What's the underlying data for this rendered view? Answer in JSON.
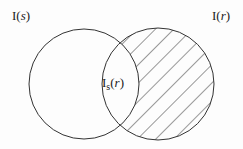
{
  "diagram": {
    "type": "venn",
    "sets": [
      {
        "id": "left",
        "label_main": "I",
        "label_arg": "s",
        "cx": 84,
        "cy": 84,
        "r": 55,
        "hatched": false
      },
      {
        "id": "right",
        "label_main": "I",
        "label_arg": "r",
        "cx": 158,
        "cy": 84,
        "r": 56,
        "hatched": true
      }
    ],
    "intersection": {
      "label_main": "I",
      "label_sub": "s",
      "label_arg": "r"
    },
    "colors": {
      "stroke": "#333333",
      "background": "#fdfdfd"
    }
  }
}
